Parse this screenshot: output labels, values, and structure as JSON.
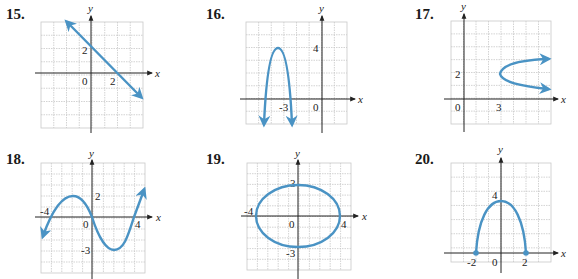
{
  "problems": [
    {
      "number": "15.",
      "label_pos": [
        6,
        6
      ]
    },
    {
      "number": "16.",
      "label_pos": [
        206,
        6
      ]
    },
    {
      "number": "17.",
      "label_pos": [
        415,
        6
      ]
    },
    {
      "number": "18.",
      "label_pos": [
        6,
        152
      ]
    },
    {
      "number": "19.",
      "label_pos": [
        206,
        152
      ]
    },
    {
      "number": "20.",
      "label_pos": [
        415,
        152
      ]
    }
  ],
  "axis_labels": {
    "x": "x",
    "y": "y"
  },
  "colors": {
    "curve": "#4a93c4",
    "grid": "#c8c8c8",
    "axis": "#222222"
  },
  "chart_data": [
    {
      "id": 15,
      "type": "line",
      "description": "Straight line with arrows, y-intercept 2, x-intercept 2",
      "points": [
        [
          -2,
          4
        ],
        [
          4,
          -2
        ]
      ],
      "arrows": "both",
      "tick_labels": {
        "x": [
          "0",
          "2"
        ],
        "y": [
          "2"
        ]
      },
      "xlim": [
        -4,
        4
      ],
      "ylim": [
        -4,
        4
      ]
    },
    {
      "id": 16,
      "type": "line",
      "description": "Downward parabola with vertex at (-3, 4), arrows pointing down",
      "vertex": [
        -3,
        4
      ],
      "arrows": "both-down",
      "tick_labels": {
        "x": [
          "-3",
          "0"
        ],
        "y": [
          "4"
        ]
      },
      "xlim": [
        -6,
        2
      ],
      "ylim": [
        -2,
        6
      ]
    },
    {
      "id": 17,
      "type": "line",
      "description": "Sideways parabola opening right with vertex at (3, 2)",
      "vertex": [
        3,
        2
      ],
      "arrows": "both-right",
      "tick_labels": {
        "x": [
          "0",
          "3"
        ],
        "y": [
          "2"
        ]
      },
      "xlim": [
        -1,
        7
      ],
      "ylim": [
        -2,
        6
      ]
    },
    {
      "id": 18,
      "type": "line",
      "description": "Cubic curve through (-4,0),(0,0),(4,0); local max 2, local min -3",
      "x_intercepts": [
        -4,
        0,
        4
      ],
      "local_max": [
        -2,
        2
      ],
      "local_min": [
        2,
        -3
      ],
      "arrows": "both",
      "tick_labels": {
        "x": [
          "-4",
          "0",
          "4"
        ],
        "y": [
          "2",
          "-3"
        ]
      },
      "xlim": [
        -5,
        5
      ],
      "ylim": [
        -5,
        5
      ]
    },
    {
      "id": 19,
      "type": "line",
      "description": "Ellipse centered at origin, x-radius 4, y-radius 3",
      "center": [
        0,
        0
      ],
      "rx": 4,
      "ry": 3,
      "tick_labels": {
        "x": [
          "-4",
          "0",
          "4"
        ],
        "y": [
          "3",
          "-3"
        ]
      },
      "xlim": [
        -5,
        5
      ],
      "ylim": [
        -5,
        5
      ]
    },
    {
      "id": 20,
      "type": "line",
      "description": "Upper semicircle-like arc from (-2,0) to (2,0) with peak at (0,4), closed endpoints",
      "endpoints": [
        [
          -2,
          0
        ],
        [
          2,
          0
        ]
      ],
      "peak": [
        0,
        4
      ],
      "tick_labels": {
        "x": [
          "-2",
          "0",
          "2"
        ],
        "y": [
          "4"
        ]
      },
      "xlim": [
        -4,
        4
      ],
      "ylim": [
        -1,
        7
      ]
    }
  ]
}
